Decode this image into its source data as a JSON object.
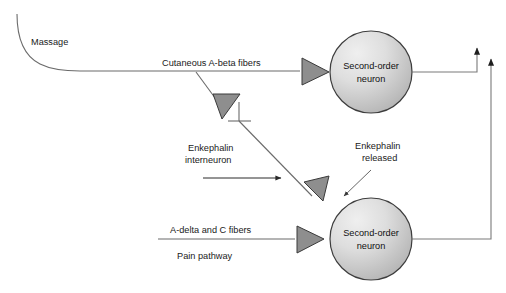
{
  "figure": {
    "background_color": "#ffffff"
  },
  "colors": {
    "soma_fill_light": "#e8e8e8",
    "soma_fill_dark": "#bfbfbf",
    "soma_stroke": "#3d3d3d",
    "synapse_fill": "#8e8e8e",
    "synapse_stroke": "#3a3a3a",
    "fiber_stroke": "#6b6b6b",
    "text": "#1a1a1a"
  },
  "labels": {
    "massage": "Massage",
    "cutaneous_fibers": "Cutaneous A-beta fibers",
    "enkephalin_interneuron_line1": "Enkephalin",
    "enkephalin_interneuron_line2": "interneuron",
    "enkephalin_released_line1": "Enkephalin",
    "enkephalin_released_line2": "released",
    "a_delta_c_fibers": "A-delta and C fibers",
    "pain_pathway": "Pain pathway"
  },
  "neurons": [
    {
      "id": "second-order-neuron-top",
      "line1": "Second-order",
      "line2": "neuron",
      "cx": 371,
      "cy": 72,
      "r": 41
    },
    {
      "id": "second-order-neuron-bottom",
      "line1": "Second-order",
      "line2": "neuron",
      "cx": 371,
      "cy": 239,
      "r": 41
    }
  ],
  "synapses": [
    {
      "id": "a-beta-to-top-neuron",
      "orientation": "right"
    },
    {
      "id": "interneuron-axon-terminal",
      "orientation": "down-left"
    },
    {
      "id": "interneuron-to-bottom-neuron",
      "orientation": "down-right"
    },
    {
      "id": "pain-fiber-to-bottom-neuron",
      "orientation": "right"
    }
  ],
  "arrows": {
    "interneuron_flow": "flow arrow pointing right",
    "ascending_top": "ascending tract arrow from top neuron",
    "ascending_bottom": "ascending tract arrow from bottom neuron",
    "enkephalin_leader": "leader arrow from Enkephalin released label"
  }
}
